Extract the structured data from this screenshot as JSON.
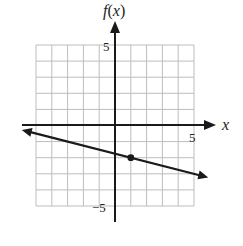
{
  "chart_data": {
    "type": "line",
    "title": "",
    "xlabel": "x",
    "ylabel": "f(x)",
    "xlim": [
      -5,
      5
    ],
    "ylim": [
      -5,
      5
    ],
    "grid": true,
    "grid_step": 1,
    "x_tick_labels": [
      {
        "value": 5,
        "label": "5"
      }
    ],
    "y_tick_labels": [
      {
        "value": 5,
        "label": "5"
      },
      {
        "value": -5,
        "label": "−5"
      }
    ],
    "series": [
      {
        "name": "f(x)",
        "kind": "line-with-arrows",
        "slope": -0.25,
        "intercept": -1.75,
        "x": [
          -5.9,
          5.9
        ],
        "y": [
          -0.275,
          -3.225
        ]
      }
    ],
    "points": [
      {
        "x": 1,
        "y": -2,
        "marker": "filled-circle"
      }
    ],
    "legend": null
  },
  "labels": {
    "y_axis": "f(x)",
    "x_axis": "x",
    "x_tick_5": "5",
    "y_tick_5": "5",
    "y_tick_neg5": "−5"
  },
  "colors": {
    "grid": "#bdbdbd",
    "axis": "#1a1a1a",
    "line": "#1a1a1a"
  }
}
